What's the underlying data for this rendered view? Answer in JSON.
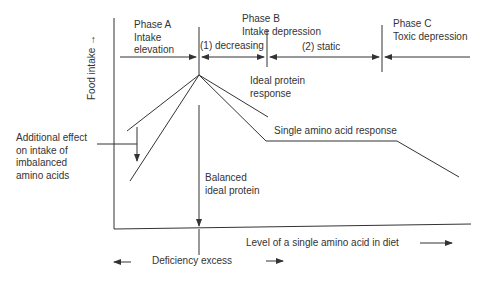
{
  "diagram": {
    "y_axis_label": "Food intake",
    "x_axis_label": "Level of a single amino acid in diet",
    "bottom_label": "Deficiency excess",
    "phases": [
      {
        "name": "Phase A",
        "description": "Intake elevation"
      },
      {
        "name": "Phase B",
        "description": "Intake depression"
      },
      {
        "name": "Phase C",
        "description": "Toxic depression"
      }
    ],
    "sub_phases": [
      "(1) decreasing",
      "(2) static"
    ],
    "curve_labels": {
      "ideal_protein": [
        "Ideal protein",
        "response"
      ],
      "single_amino_acid": "Single amino acid response",
      "balanced": [
        "Balanced",
        "ideal protein"
      ],
      "additional_effect": [
        "Additional effect",
        "on intake of",
        "imbalanced",
        "amino acids"
      ]
    },
    "line_color": "#333333"
  }
}
